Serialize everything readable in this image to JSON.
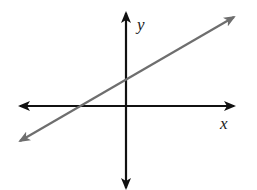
{
  "diagram": {
    "type": "coordinate-plane-line",
    "axes": {
      "x_label": "x",
      "y_label": "y",
      "color": "#111111"
    },
    "line": {
      "color": "#6e6e6e",
      "slope_sign": "positive",
      "y_intercept": "positive",
      "x_intercept": "negative",
      "arrows": "both ends"
    }
  }
}
